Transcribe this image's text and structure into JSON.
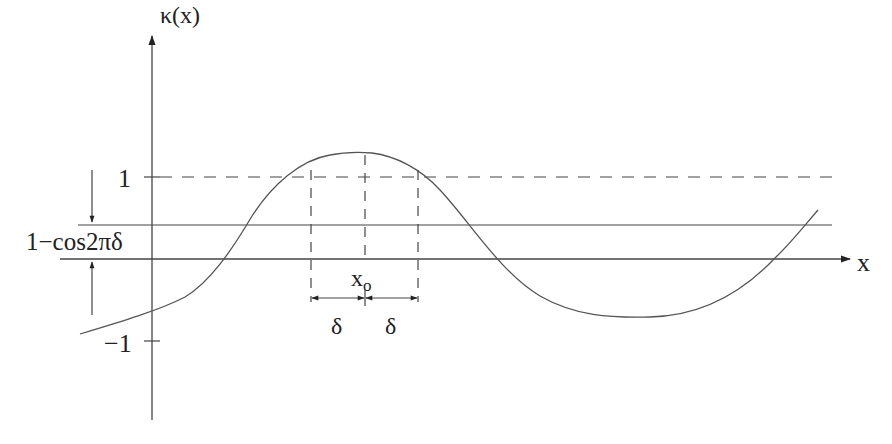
{
  "diagram": {
    "y_axis_label": "κ(x)",
    "x_axis_label": "x",
    "tick_labels": {
      "plus_one": "1",
      "minus_one": "−1"
    },
    "threshold_label": "1−cos2πδ",
    "peak_label_base": "x",
    "peak_label_sub": "o",
    "delta_left": "δ",
    "delta_right": "δ",
    "colors": {
      "line": "#444444",
      "text": "#222222",
      "background": "#ffffff"
    }
  }
}
